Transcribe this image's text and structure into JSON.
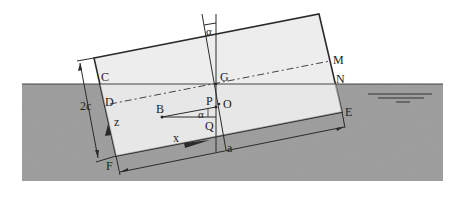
{
  "diagram": {
    "colors": {
      "water": "#9a9a9a",
      "body_fill": "#ececec",
      "line": "#2a2a2a",
      "background": "#ffffff"
    },
    "labels": {
      "C": "C",
      "D": "D",
      "F": "F",
      "G": "G",
      "M": "M",
      "N": "N",
      "B": "B",
      "P": "P",
      "O": "O",
      "Q": "Q",
      "E": "E",
      "alpha_top": "α",
      "alpha_mid": "α",
      "z_axis": "z",
      "x_axis": "x",
      "dim_2c": "2c",
      "dim_a": "a"
    },
    "water_surface_symbol": "free-surface-icon"
  }
}
